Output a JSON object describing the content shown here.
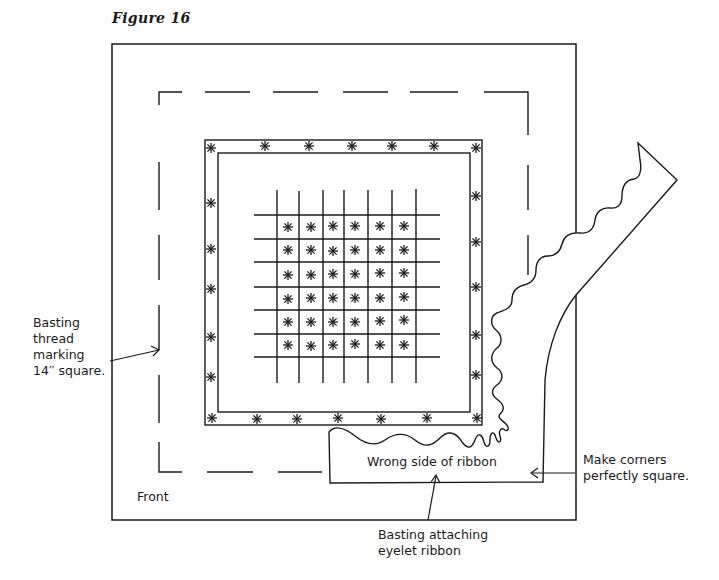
{
  "figure": {
    "title": "Figure 16"
  },
  "labels": {
    "basting_thread": [
      "Basting",
      "thread",
      "marking",
      "14′′ square."
    ],
    "front": "Front",
    "wrong_side": "Wrong side of ribbon",
    "make_corners": [
      "Make corners",
      "perfectly square."
    ],
    "basting_attaching": [
      "Basting attaching",
      "eyelet ribbon"
    ]
  },
  "colors": {
    "ink": "#1a1a1a",
    "paper": "#ffffff"
  },
  "elements": {
    "outer_fabric_square": "fabric edge",
    "dashed_square": "basting thread marking 14 inch square",
    "ribbon_frame": "eyelet ribbon border with cross-stitch stars",
    "cross_stitch_grid": {
      "rows": 6,
      "cols": 6,
      "stitch": "asterisk"
    },
    "loose_ribbon": "wavy-edged ribbon end turned back"
  }
}
